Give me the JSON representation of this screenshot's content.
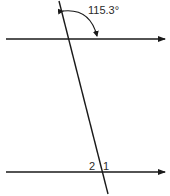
{
  "diagram": {
    "type": "parallel-lines-transversal",
    "angle_label": "115.3°",
    "angle_labels": {
      "angle_2": "2",
      "angle_1": "1"
    },
    "colors": {
      "line": "#1a1a1a",
      "text": "#2a2a2a",
      "background": "#ffffff"
    }
  }
}
